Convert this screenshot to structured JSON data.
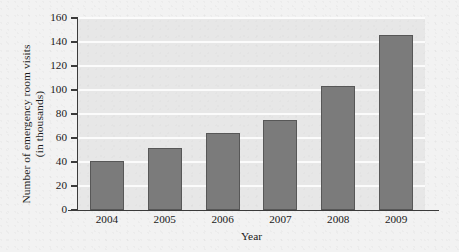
{
  "chart_data": {
    "type": "bar",
    "title": "",
    "xlabel": "Year",
    "ylabel_line1": "Number of emergency room visits",
    "ylabel_line2": "(in thousands)",
    "categories": [
      "2004",
      "2005",
      "2006",
      "2007",
      "2008",
      "2009"
    ],
    "values": [
      41,
      52,
      64,
      75,
      103,
      146
    ],
    "yticks": [
      "0",
      "20",
      "40",
      "60",
      "80",
      "100",
      "120",
      "140",
      "160"
    ],
    "ytick_values": [
      0,
      20,
      40,
      60,
      80,
      100,
      120,
      140,
      160
    ],
    "ylim": [
      0,
      160
    ],
    "grid": true,
    "legend": "none",
    "colors": {
      "bar_fill": "#7b7b7b",
      "bar_edge": "#575757",
      "plot_background": "#e7e7e7",
      "figure_background": "#f2f2f2",
      "gridline": "#fbfbfb",
      "axis": "#3b3b3b",
      "text": "#1a1a1a"
    }
  }
}
